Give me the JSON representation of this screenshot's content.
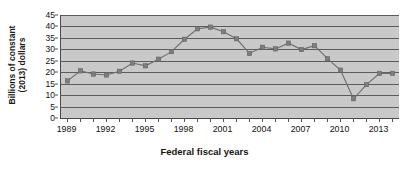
{
  "chart_data": {
    "type": "line",
    "title": "",
    "xlabel": "Federal fiscal years",
    "ylabel": "Billions of constant (2013) dollars",
    "ylabel_lines": [
      "Billions of constant",
      "(2013) dollars"
    ],
    "ylim": [
      0,
      45
    ],
    "xlim": [
      1988.5,
      2014.5
    ],
    "yticks": [
      0,
      5,
      10,
      15,
      20,
      25,
      30,
      35,
      40,
      45
    ],
    "ytick_labels": [
      "0",
      "5",
      "10",
      "15",
      "20",
      "25",
      "30",
      "35",
      "40",
      "45"
    ],
    "xticks": [
      1989,
      1990,
      1991,
      1992,
      1993,
      1994,
      1995,
      1996,
      1997,
      1998,
      1999,
      2000,
      2001,
      2002,
      2003,
      2004,
      2005,
      2006,
      2007,
      2008,
      2009,
      2010,
      2011,
      2012,
      2013,
      2014
    ],
    "xtick_labels_shown": [
      "1989",
      "1992",
      "1995",
      "1998",
      "2001",
      "2004",
      "2007",
      "2010",
      "2013"
    ],
    "xtick_labels_shown_values": [
      1989,
      1992,
      1995,
      1998,
      2001,
      2004,
      2007,
      2010,
      2013
    ],
    "grid": true,
    "grid_axis": "y",
    "legend": "none",
    "marker": "square",
    "x": [
      1989,
      1990,
      1991,
      1992,
      1993,
      1994,
      1995,
      1996,
      1997,
      1998,
      1999,
      2000,
      2001,
      2002,
      2003,
      2004,
      2005,
      2006,
      2007,
      2008,
      2009,
      2010,
      2011,
      2012,
      2013,
      2014
    ],
    "values": [
      16.2,
      20.6,
      19.2,
      18.8,
      20.4,
      24.0,
      22.8,
      25.7,
      29.0,
      34.4,
      39.0,
      39.7,
      37.7,
      34.6,
      28.2,
      30.9,
      30.2,
      32.7,
      29.9,
      31.6,
      25.9,
      20.9,
      8.4,
      14.6,
      19.5,
      19.5
    ],
    "plot_bg_color": "#c9c9c9",
    "line_color": "#6e6e6e",
    "marker_color": "#7d7d7d",
    "gridline_color": "#5c5c5c",
    "axis_color": "#4a4a4a"
  }
}
